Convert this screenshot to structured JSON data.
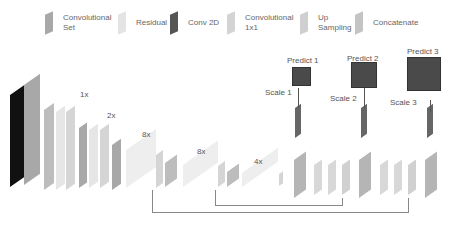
{
  "legend": [
    {
      "label": "Convolutional Set",
      "color": "#a8a8a8"
    },
    {
      "label": "Residual",
      "color": "#e4e4e4"
    },
    {
      "label": "Conv 2D",
      "color": "#555555"
    },
    {
      "label": "Convolutional 1x1",
      "color": "#d4d4d4"
    },
    {
      "label": "Up Sampling",
      "color": "#cfcfcf"
    },
    {
      "label": "Concatenate",
      "color": "#c4c4c4"
    }
  ],
  "backbone": {
    "repeats": [
      "1x",
      "2x",
      "8x",
      "8x",
      "4x"
    ]
  },
  "heads": [
    {
      "predict": "Predict 1",
      "scale": "Scale 1"
    },
    {
      "predict": "Predict 2",
      "scale": "Scale 2"
    },
    {
      "predict": "Predict 3",
      "scale": "Scale 3"
    }
  ]
}
